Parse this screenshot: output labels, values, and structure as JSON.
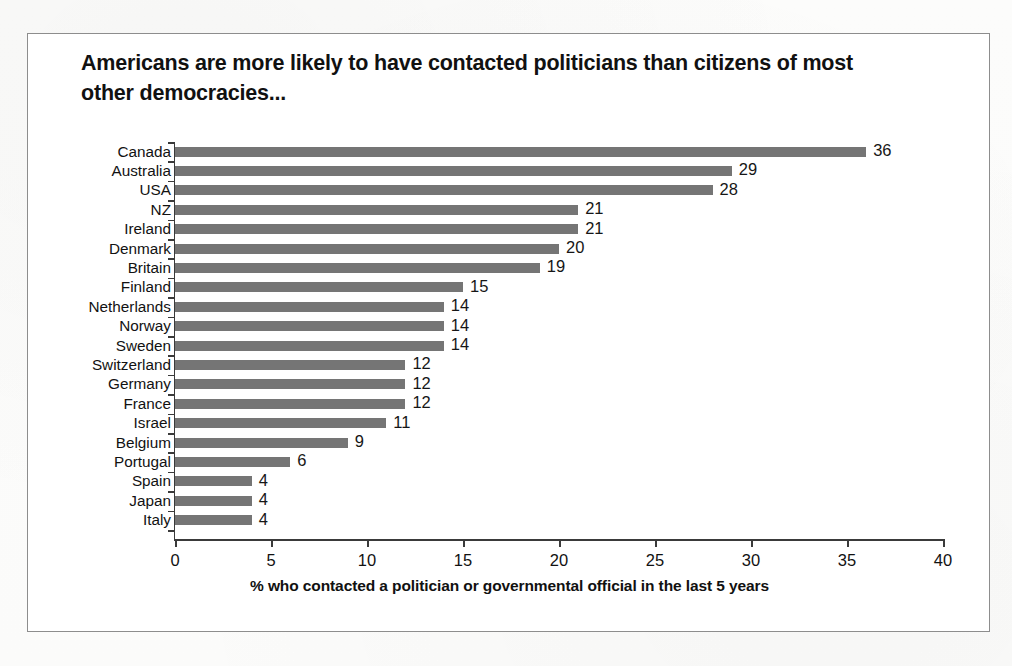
{
  "figure": {
    "title": "Americans are more likely to have contacted politicians than citizens of most other democracies...",
    "frame_color": "#8d8d8d",
    "background_color": "#ffffff"
  },
  "chart_data": {
    "type": "bar",
    "orientation": "horizontal",
    "title": "Americans are more likely to have contacted politicians than citizens of most other democracies...",
    "xlabel": "% who contacted a politician or governmental official in the last 5 years",
    "ylabel": "",
    "xlim": [
      0,
      40
    ],
    "xticks": [
      0,
      5,
      10,
      15,
      20,
      25,
      30,
      35,
      40
    ],
    "xtick_labels": [
      "0",
      "5",
      "10",
      "15",
      "20",
      "25",
      "30",
      "35",
      "40"
    ],
    "grid": false,
    "legend": false,
    "bar_color": "#757575",
    "value_labels": true,
    "categories": [
      "Canada",
      "Australia",
      "USA",
      "NZ",
      "Ireland",
      "Denmark",
      "Britain",
      "Finland",
      "Netherlands",
      "Norway",
      "Sweden",
      "Switzerland",
      "Germany",
      "France",
      "Israel",
      "Belgium",
      "Portugal",
      "Spain",
      "Japan",
      "Italy"
    ],
    "values": [
      36,
      29,
      28,
      21,
      21,
      20,
      19,
      15,
      14,
      14,
      14,
      12,
      12,
      12,
      11,
      9,
      6,
      4,
      4,
      4
    ]
  }
}
